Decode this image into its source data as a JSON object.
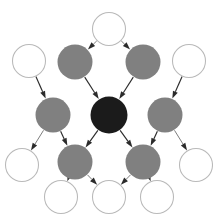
{
  "diagram": {
    "type": "directed-graph",
    "canvas": {
      "width": 213,
      "height": 219,
      "background": "#ffffff"
    },
    "palette": {
      "node_dark": "#1b1b1b",
      "node_gray": "#808080",
      "node_white_fill": "#ffffff",
      "node_white_stroke": "#b9b9b9",
      "edge_strong": "#2b2b2b",
      "edge_faint": "#7d7d7d"
    },
    "legend_classes": [
      {
        "id": "dark",
        "label": "dark node",
        "fill": "#1b1b1b"
      },
      {
        "id": "gray",
        "label": "gray node",
        "fill": "#808080"
      },
      {
        "id": "white",
        "label": "white node",
        "fill": "#ffffff"
      }
    ],
    "nodes": [
      {
        "id": "n-top",
        "label": "",
        "cx": 109,
        "cy": 29,
        "r": 16.5,
        "style": "white"
      },
      {
        "id": "n-upper-left-outer",
        "label": "",
        "cx": 29,
        "cy": 61,
        "r": 16.5,
        "style": "white"
      },
      {
        "id": "n-upper-right-outer",
        "label": "",
        "cx": 189,
        "cy": 61,
        "r": 16.5,
        "style": "white"
      },
      {
        "id": "n-upper-left-gray",
        "label": "",
        "cx": 75,
        "cy": 62,
        "r": 17.5,
        "style": "gray"
      },
      {
        "id": "n-upper-right-gray",
        "label": "",
        "cx": 143,
        "cy": 62,
        "r": 17.5,
        "style": "gray"
      },
      {
        "id": "n-mid-left-gray",
        "label": "",
        "cx": 53,
        "cy": 115,
        "r": 17.5,
        "style": "gray"
      },
      {
        "id": "n-center-dark",
        "label": "",
        "cx": 109,
        "cy": 115,
        "r": 18.5,
        "style": "dark"
      },
      {
        "id": "n-mid-right-gray",
        "label": "",
        "cx": 165,
        "cy": 115,
        "r": 17.5,
        "style": "gray"
      },
      {
        "id": "n-mid-left-white",
        "label": "",
        "cx": 22,
        "cy": 165,
        "r": 16.5,
        "style": "white"
      },
      {
        "id": "n-mid-right-white",
        "label": "",
        "cx": 196,
        "cy": 165,
        "r": 16.5,
        "style": "white"
      },
      {
        "id": "n-lower-left-gray",
        "label": "",
        "cx": 75,
        "cy": 162,
        "r": 17.5,
        "style": "gray"
      },
      {
        "id": "n-lower-right-gray",
        "label": "",
        "cx": 143,
        "cy": 162,
        "r": 17.5,
        "style": "gray"
      },
      {
        "id": "n-bottom-left-white",
        "label": "",
        "cx": 61,
        "cy": 197,
        "r": 16.5,
        "style": "white"
      },
      {
        "id": "n-bottom-center-white",
        "label": "",
        "cx": 109,
        "cy": 197,
        "r": 16.5,
        "style": "white"
      },
      {
        "id": "n-bottom-right-white",
        "label": "",
        "cx": 157,
        "cy": 197,
        "r": 16.5,
        "style": "white"
      }
    ],
    "edges": [
      {
        "id": "e-top-to-upper-left-gray",
        "from": "n-top",
        "to": "n-upper-left-gray",
        "weight": "faint"
      },
      {
        "id": "e-top-to-upper-right-gray",
        "from": "n-top",
        "to": "n-upper-right-gray",
        "weight": "faint"
      },
      {
        "id": "e-upper-left-outer-to-mid-left-gray",
        "from": "n-upper-left-outer",
        "to": "n-mid-left-gray",
        "weight": "strong"
      },
      {
        "id": "e-upper-right-outer-to-mid-right-gray",
        "from": "n-upper-right-outer",
        "to": "n-mid-right-gray",
        "weight": "strong"
      },
      {
        "id": "e-upper-left-gray-to-center",
        "from": "n-upper-left-gray",
        "to": "n-center-dark",
        "weight": "strong"
      },
      {
        "id": "e-upper-right-gray-to-center",
        "from": "n-upper-right-gray",
        "to": "n-center-dark",
        "weight": "strong"
      },
      {
        "id": "e-center-to-lower-left-gray",
        "from": "n-center-dark",
        "to": "n-lower-left-gray",
        "weight": "strong"
      },
      {
        "id": "e-center-to-lower-right-gray",
        "from": "n-center-dark",
        "to": "n-lower-right-gray",
        "weight": "strong"
      },
      {
        "id": "e-mid-left-gray-to-lower-left-gray",
        "from": "n-mid-left-gray",
        "to": "n-lower-left-gray",
        "weight": "strong"
      },
      {
        "id": "e-mid-right-gray-to-lower-right-gray",
        "from": "n-mid-right-gray",
        "to": "n-lower-right-gray",
        "weight": "strong"
      },
      {
        "id": "e-mid-left-gray-to-mid-left-white",
        "from": "n-mid-left-gray",
        "to": "n-mid-left-white",
        "weight": "faint"
      },
      {
        "id": "e-mid-right-gray-to-mid-right-white",
        "from": "n-mid-right-gray",
        "to": "n-mid-right-white",
        "weight": "faint"
      },
      {
        "id": "e-lower-left-gray-to-bottom-left-white",
        "from": "n-lower-left-gray",
        "to": "n-bottom-left-white",
        "weight": "faint"
      },
      {
        "id": "e-lower-left-gray-to-bottom-center-white",
        "from": "n-lower-left-gray",
        "to": "n-bottom-center-white",
        "weight": "faint"
      },
      {
        "id": "e-lower-right-gray-to-bottom-center-white",
        "from": "n-lower-right-gray",
        "to": "n-bottom-center-white",
        "weight": "faint"
      },
      {
        "id": "e-lower-right-gray-to-bottom-right-white",
        "from": "n-lower-right-gray",
        "to": "n-bottom-right-white",
        "weight": "faint"
      }
    ]
  }
}
